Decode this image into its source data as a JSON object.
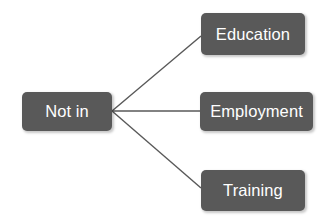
{
  "diagram": {
    "type": "tree",
    "colors": {
      "node_fill": "#595959",
      "node_text": "#ffffff",
      "connector": "#595959",
      "background": "#ffffff"
    },
    "root": {
      "id": "not-in",
      "label": "Not in"
    },
    "branches": [
      {
        "id": "education",
        "label": "Education"
      },
      {
        "id": "employment",
        "label": "Employment"
      },
      {
        "id": "training",
        "label": "Training"
      }
    ],
    "connections": [
      {
        "from": "not-in",
        "to": "education"
      },
      {
        "from": "not-in",
        "to": "employment"
      },
      {
        "from": "not-in",
        "to": "training"
      }
    ]
  }
}
